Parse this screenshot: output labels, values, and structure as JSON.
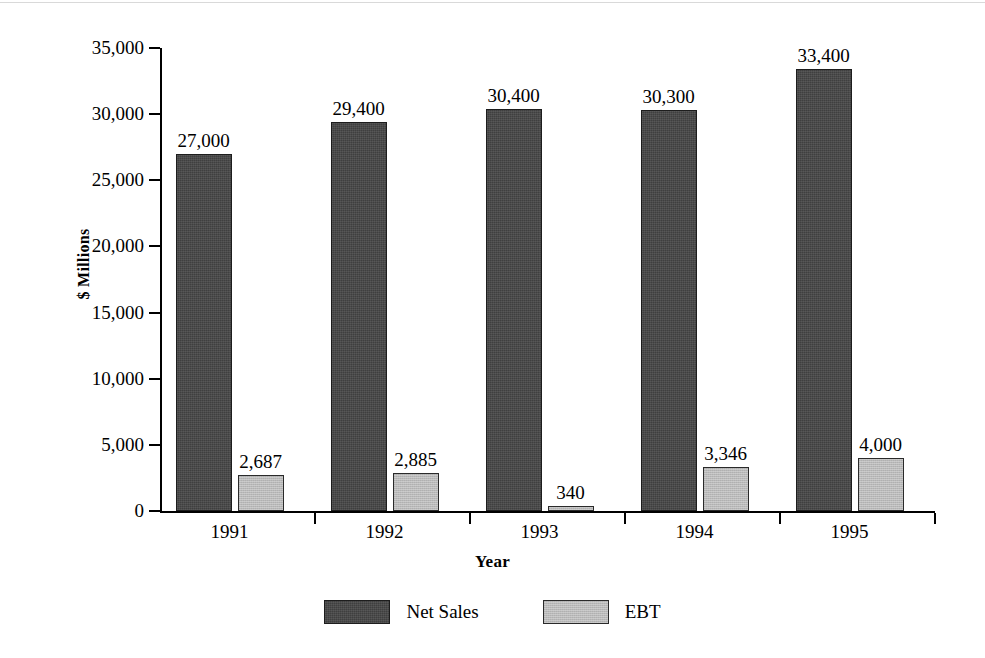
{
  "chart_data": {
    "type": "bar",
    "title": "",
    "xlabel": "Year",
    "ylabel": "$ Millions",
    "categories": [
      "1991",
      "1992",
      "1993",
      "1994",
      "1995"
    ],
    "series": [
      {
        "name": "Net Sales",
        "color": "#3f3f3f",
        "values": [
          27000,
          29400,
          30400,
          30300,
          33400
        ],
        "labels": [
          "27,000",
          "29,400",
          "30,400",
          "30,300",
          "33,400"
        ]
      },
      {
        "name": "EBT",
        "color": "#b9b9b9",
        "values": [
          2687,
          2885,
          340,
          3346,
          4000
        ],
        "labels": [
          "2,687",
          "2,885",
          "340",
          "3,346",
          "4,000"
        ]
      }
    ],
    "ylim": [
      0,
      35000
    ],
    "ytick_values": [
      0,
      5000,
      10000,
      15000,
      20000,
      25000,
      30000,
      35000
    ],
    "ytick_labels": [
      "0",
      "5,000",
      "10,000",
      "15,000",
      "20,000",
      "25,000",
      "30,000",
      "35,000"
    ],
    "grid": false,
    "legend_position": "bottom",
    "value_labels_shown": true
  },
  "legend": {
    "items": [
      {
        "label": "Net Sales",
        "swatch": "net-sales"
      },
      {
        "label": "EBT",
        "swatch": "ebt"
      }
    ]
  }
}
